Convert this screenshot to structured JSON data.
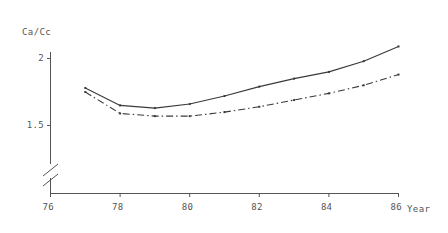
{
  "chart_data": {
    "type": "line",
    "title": "",
    "xlabel": "Year",
    "ylabel": "Ca/Cc",
    "xlim": [
      76,
      86
    ],
    "ylim": [
      1.42,
      2.12
    ],
    "grid": false,
    "legend": "none",
    "y_axis_break": true,
    "y_axis_break_symbol": "//",
    "x_ticks": [
      "76",
      "78",
      "80",
      "82",
      "84",
      "86"
    ],
    "x_tick_values": [
      76,
      78,
      80,
      82,
      84,
      86
    ],
    "y_ticks": [
      "1.5",
      "2"
    ],
    "y_tick_values": [
      1.5,
      2.0
    ],
    "x": [
      77,
      78,
      79,
      80,
      81,
      82,
      83,
      84,
      85,
      86
    ],
    "series": [
      {
        "name": "solid-series",
        "style": "solid",
        "color": "#3a3a3a",
        "markers": true,
        "values": [
          1.78,
          1.65,
          1.63,
          1.66,
          1.72,
          1.79,
          1.85,
          1.9,
          1.98,
          2.09
        ]
      },
      {
        "name": "dash-dot-series",
        "style": "dash-dot",
        "color": "#3a3a3a",
        "markers": true,
        "values": [
          1.75,
          1.59,
          1.57,
          1.57,
          1.6,
          1.64,
          1.69,
          1.74,
          1.8,
          1.88
        ]
      }
    ]
  },
  "axes": {
    "x_title": "Year",
    "y_title": "Ca/Cc"
  }
}
